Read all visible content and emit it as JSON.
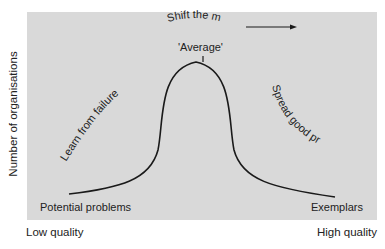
{
  "axes": {
    "y_label": "Number of organisations",
    "x_low_label": "Low quality",
    "x_high_label": "High quality"
  },
  "annotations": {
    "shift": "Shift the mean",
    "average": "'Average'",
    "learn": "Learn from failures",
    "spread": "Spread good practice",
    "potential": "Potential problems",
    "exemplars": "Exemplars"
  },
  "colors": {
    "panel": "#d9d9d9",
    "curve": "#1a1a1a",
    "text": "#222222"
  }
}
